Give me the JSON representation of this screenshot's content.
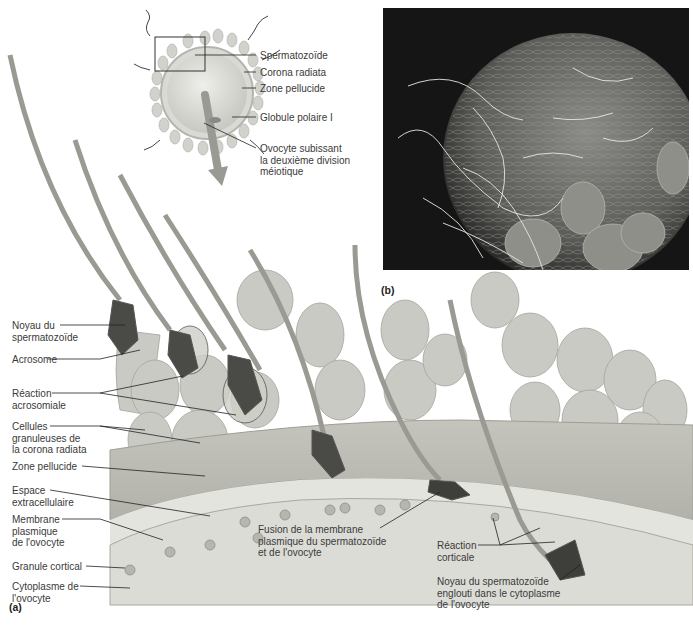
{
  "figure": {
    "panel_a_label": "(a)",
    "panel_b_label": "(b)"
  },
  "inset_labels": [
    {
      "id": "spermatozoide",
      "text": "Spermatozoïde"
    },
    {
      "id": "corona-radiata",
      "text": "Corona radiata"
    },
    {
      "id": "zone-pellucide",
      "text": "Zone pellucide"
    },
    {
      "id": "globule-polaire",
      "text": "Globule polaire I"
    },
    {
      "id": "ovocyte",
      "text": "Ovocyte subissant\nla deuxième division\nméiotique"
    }
  ],
  "left_labels": [
    {
      "id": "noyau",
      "text": "Noyau du\nspermatozoïde"
    },
    {
      "id": "acrosome",
      "text": "Acrosome"
    },
    {
      "id": "reaction-acrosomiale",
      "text": "Réaction\nacrosomiale"
    },
    {
      "id": "cellules-granuleuses",
      "text": "Cellules\ngranuleuses de\nla corona radiata"
    },
    {
      "id": "zone-pellucide",
      "text": "Zone pellucide"
    },
    {
      "id": "espace",
      "text": "Espace\nextracellulaire"
    },
    {
      "id": "membrane",
      "text": "Membrane\nplasmique\nde l'ovocyte"
    },
    {
      "id": "granule",
      "text": "Granule cortical"
    },
    {
      "id": "cytoplasme",
      "text": "Cytoplasme de\nl'ovocyte"
    }
  ],
  "bottom_labels": [
    {
      "id": "fusion",
      "text": "Fusion de la membrane\nplasmique du spermatozoïde\net de l'ovocyte"
    },
    {
      "id": "reaction-corticale",
      "text": "Réaction\ncorticale"
    },
    {
      "id": "noyau-englouti",
      "text": "Noyau du spermatozoïde\nenglouti dans le cytoplasme\nde l'ovocyte"
    }
  ]
}
